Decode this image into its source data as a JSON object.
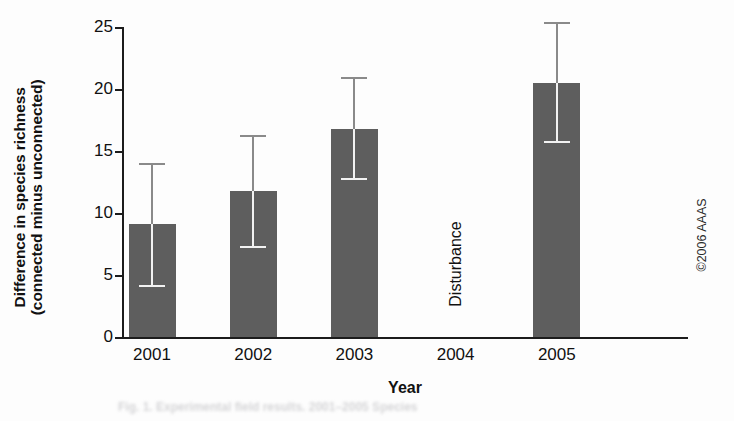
{
  "chart_data": {
    "type": "bar",
    "title": "",
    "xlabel": "Year",
    "ylabel": "Difference in species richness (connected minus unconnected)",
    "ylabel_line1": "Difference in species richness",
    "ylabel_line2": "(connected minus unconnected)",
    "categories": [
      "2001",
      "2002",
      "2003",
      "2004",
      "2005"
    ],
    "values": [
      9.1,
      11.8,
      16.8,
      null,
      20.5
    ],
    "error_low": [
      4.2,
      7.3,
      12.8,
      null,
      15.8
    ],
    "error_high": [
      14.0,
      16.3,
      21.0,
      null,
      25.4
    ],
    "ylim": [
      0,
      25
    ],
    "yticks": [
      0,
      5,
      10,
      15,
      20,
      25
    ],
    "ytick_labels": [
      "0",
      "5",
      "10",
      "15",
      "20",
      "25"
    ],
    "grid": false,
    "legend": "none",
    "bar_color": "#5e5e5e",
    "axis_color": "#1c1c1c",
    "annotations": [
      {
        "text": "Disturbance",
        "category": "2004",
        "rotation": -90
      }
    ]
  },
  "credit": {
    "text": "©2006 AAAS"
  },
  "caption_ghost": {
    "text": "Fig. 1. Experimental field results. 2001–2005 Species"
  }
}
